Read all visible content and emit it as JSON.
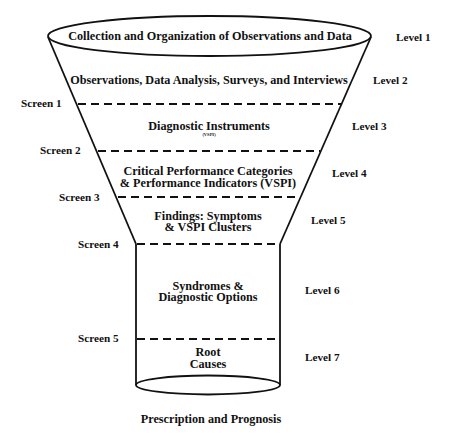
{
  "diagram": {
    "type": "funnel",
    "stroke_color": "#111111",
    "background": "#ffffff",
    "levels": [
      {
        "id": 1,
        "label": "Level 1",
        "text": [
          "Collection and Organization of Observations and Data"
        ]
      },
      {
        "id": 2,
        "label": "Level 2",
        "text": [
          "Observations, Data Analysis, Surveys, and Interviews"
        ]
      },
      {
        "id": 3,
        "label": "Level 3",
        "text": [
          "Diagnostic Instruments"
        ],
        "subtext": "(VSPI)"
      },
      {
        "id": 4,
        "label": "Level 4",
        "text": [
          "Critical Performance Categories",
          "& Performance Indicators (VSPI)"
        ]
      },
      {
        "id": 5,
        "label": "Level 5",
        "text": [
          "Findings: Symptoms",
          "& VSPI Clusters"
        ]
      },
      {
        "id": 6,
        "label": "Level 6",
        "text": [
          "Syndromes &",
          "Diagnostic Options"
        ]
      },
      {
        "id": 7,
        "label": "Level 7",
        "text": [
          "Root",
          "Causes"
        ]
      }
    ],
    "screens": [
      {
        "id": 1,
        "label": "Screen 1"
      },
      {
        "id": 2,
        "label": "Screen 2"
      },
      {
        "id": 3,
        "label": "Screen 3"
      },
      {
        "id": 4,
        "label": "Screen 4"
      },
      {
        "id": 5,
        "label": "Screen 5"
      }
    ],
    "caption": "Prescription and Prognosis"
  }
}
